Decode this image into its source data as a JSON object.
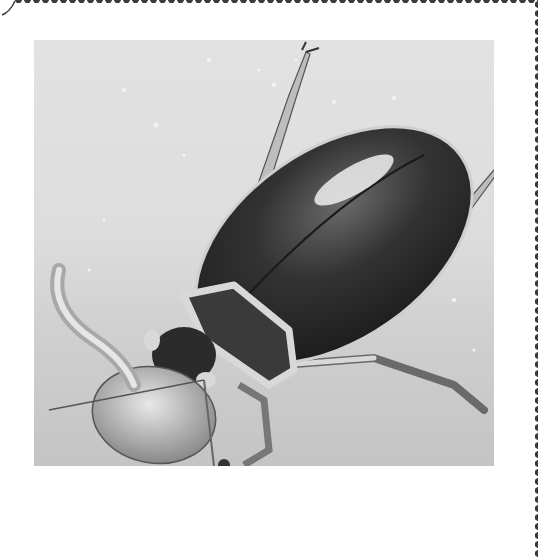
{
  "image": {
    "subject": "diving beetle illustration",
    "style": "grayscale pencil drawing on stamp",
    "description": "Great diving beetle grasping a tadpole/prey on sandy water bottom with air bubbles",
    "colors": {
      "paper": "#ffffff",
      "perforation": "#3a3a3a",
      "water_background": "#dcdcdc",
      "sand": "#c4c4c4",
      "beetle_shell": "#2e2e2e",
      "highlight": "#f2f2f2"
    }
  }
}
